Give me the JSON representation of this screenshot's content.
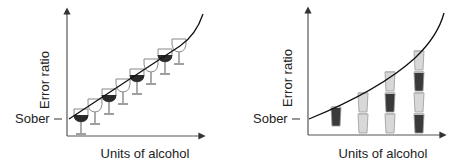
{
  "diagrams": [
    {
      "ylabel": "Error ratio",
      "xlabel": "Units of alcohol",
      "baseline_label": "Sober",
      "drink_type": "wine glass",
      "glass_count": 8,
      "glass_pattern": [
        "dark",
        "light",
        "dark",
        "light",
        "dark",
        "light",
        "dark",
        "light"
      ]
    },
    {
      "ylabel": "Error ratio",
      "xlabel": "Units of alcohol",
      "baseline_label": "Sober",
      "drink_type": "beer glass stacks",
      "stacks": [
        [
          "dark"
        ],
        [
          "light",
          "light"
        ],
        [
          "light",
          "dark",
          "light"
        ],
        [
          "dark",
          "light",
          "dark",
          "light"
        ]
      ]
    }
  ],
  "colors": {
    "dark": "#2a2a2a",
    "light": "#d8d8d8",
    "stem": "#888888",
    "axis": "#333333"
  }
}
